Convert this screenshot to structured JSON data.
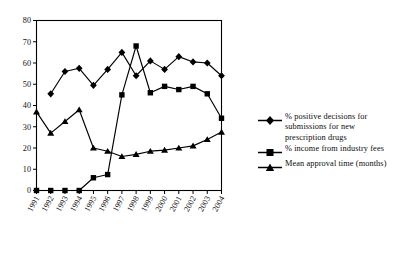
{
  "chart_data": {
    "type": "line",
    "title": "",
    "subtitle": "",
    "xlabel": "",
    "ylabel": "",
    "xlim": [
      1991,
      2004
    ],
    "ylim": [
      0,
      80
    ],
    "ytick_step": 10,
    "yticks": [
      0,
      10,
      20,
      30,
      40,
      50,
      60,
      70,
      80
    ],
    "grid": false,
    "legend_position": "right",
    "categories": [
      "1991",
      "1992",
      "1993",
      "1994",
      "1995",
      "1996",
      "1997",
      "1998",
      "1999",
      "2000",
      "2001",
      "2002",
      "2003",
      "2004"
    ],
    "series": [
      {
        "name": "% positive decisions for submissions for new prescription drugs",
        "marker": "diamond",
        "color": "#000000",
        "values": [
          null,
          45.5,
          56,
          57.5,
          49.5,
          57,
          65,
          54,
          61,
          57,
          63,
          60.5,
          60,
          54
        ]
      },
      {
        "name": "% income from industry fees",
        "marker": "square",
        "color": "#000000",
        "values": [
          0,
          0,
          0,
          0,
          6,
          7.5,
          45,
          68,
          46,
          49,
          47.5,
          49,
          45.5,
          34
        ]
      },
      {
        "name": "Mean approval time (months)",
        "marker": "triangle",
        "color": "#000000",
        "values": [
          37,
          27,
          32.5,
          38,
          20,
          18.5,
          16,
          17,
          18.5,
          19,
          20,
          21,
          24,
          27.5
        ]
      }
    ]
  },
  "legend": {
    "items": [
      {
        "label": "% positive decisions for submissions for new prescription drugs",
        "marker": "diamond"
      },
      {
        "label": "% income from industry fees",
        "marker": "square"
      },
      {
        "label": "Mean approval time (months)",
        "marker": "triangle"
      }
    ]
  },
  "colors": {
    "ink": "#000000",
    "background": "#ffffff"
  }
}
